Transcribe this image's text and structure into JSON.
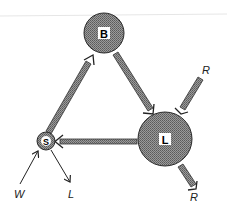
{
  "diagram": {
    "type": "flow-cycle",
    "colors": {
      "node_fill": "#8a8a8a",
      "node_stroke": "#2a2a2a",
      "arrow_fill": "#8c8c8c",
      "label_bg": "#ffffff",
      "thin_arrow": "#222222"
    },
    "nodes": [
      {
        "id": "B",
        "label": "B"
      },
      {
        "id": "L",
        "label": "L"
      },
      {
        "id": "S",
        "label": "S"
      }
    ],
    "edges": [
      {
        "from": "S",
        "to": "B",
        "style": "thick"
      },
      {
        "from": "B",
        "to": "L",
        "style": "thick"
      },
      {
        "from": "L",
        "to": "S",
        "style": "thick"
      },
      {
        "from": "R_in",
        "to": "L",
        "style": "thick",
        "label": "R"
      },
      {
        "from": "L",
        "to": "R_out",
        "style": "thick",
        "label": "R"
      },
      {
        "from": "W",
        "to": "S",
        "style": "thin",
        "label": "W"
      },
      {
        "from": "S",
        "to": "L_out",
        "style": "thin",
        "label": "L"
      }
    ],
    "external_labels": {
      "r_in": "R",
      "r_out": "R",
      "w_in": "W",
      "l_out": "L"
    }
  }
}
